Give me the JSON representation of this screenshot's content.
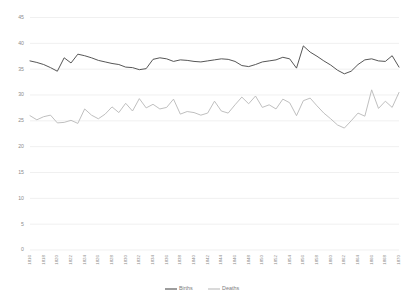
{
  "chart_data": {
    "type": "line",
    "title": "",
    "subtitle": "",
    "xlabel": "",
    "ylabel": "",
    "ylim": [
      0,
      45
    ],
    "ytick_step": 5,
    "yticks": [
      0,
      5,
      10,
      15,
      20,
      25,
      30,
      35,
      40,
      45
    ],
    "grid": true,
    "grid_axis": "y",
    "legend_position": "bottom-center",
    "x": [
      1816,
      1817,
      1818,
      1819,
      1820,
      1821,
      1822,
      1823,
      1824,
      1825,
      1826,
      1827,
      1828,
      1829,
      1830,
      1831,
      1832,
      1833,
      1834,
      1835,
      1836,
      1837,
      1838,
      1839,
      1840,
      1841,
      1842,
      1843,
      1844,
      1845,
      1846,
      1847,
      1848,
      1849,
      1850,
      1851,
      1852,
      1853,
      1854,
      1855,
      1856,
      1857,
      1858,
      1859,
      1860,
      1861,
      1862,
      1863,
      1864,
      1865,
      1866,
      1867,
      1868,
      1869,
      1870
    ],
    "xtick_labels": [
      "1816",
      "1818",
      "1820",
      "1822",
      "1824",
      "1826",
      "1828",
      "1830",
      "1832",
      "1834",
      "1836",
      "1838",
      "1840",
      "1842",
      "1844",
      "1846",
      "1848",
      "1850",
      "1852",
      "1854",
      "1856",
      "1858",
      "1860",
      "1862",
      "1864",
      "1866",
      "1868",
      "1870"
    ],
    "xtick_values": [
      1816,
      1818,
      1820,
      1822,
      1824,
      1826,
      1828,
      1830,
      1832,
      1834,
      1836,
      1838,
      1840,
      1842,
      1844,
      1846,
      1848,
      1850,
      1852,
      1854,
      1856,
      1858,
      1860,
      1862,
      1864,
      1866,
      1868,
      1870
    ],
    "xtick_rotation": -90,
    "series": [
      {
        "name": "Births",
        "color": "#4d4d4d",
        "values": [
          36.6,
          36.3,
          35.9,
          35.3,
          34.6,
          37.2,
          36.2,
          37.9,
          37.6,
          37.2,
          36.7,
          36.4,
          36.1,
          35.9,
          35.4,
          35.3,
          34.9,
          35.1,
          36.9,
          37.2,
          37.0,
          36.5,
          36.8,
          36.7,
          36.5,
          36.4,
          36.6,
          36.8,
          37.0,
          36.9,
          36.5,
          35.7,
          35.5,
          35.9,
          36.4,
          36.6,
          36.8,
          37.3,
          37.0,
          35.2,
          39.5,
          38.3,
          37.5,
          36.6,
          35.8,
          34.8,
          34.1,
          34.6,
          35.9,
          36.8,
          37.0,
          36.6,
          36.5,
          37.6,
          35.4
        ]
      },
      {
        "name": "Deaths",
        "color": "#bcbcbc",
        "values": [
          26.0,
          25.2,
          25.8,
          26.1,
          24.6,
          24.7,
          25.1,
          24.5,
          27.3,
          26.1,
          25.4,
          26.3,
          27.7,
          26.6,
          28.4,
          26.9,
          29.3,
          27.5,
          28.2,
          27.3,
          27.6,
          29.2,
          26.3,
          26.8,
          26.6,
          26.1,
          26.5,
          28.8,
          26.9,
          26.5,
          28.1,
          29.6,
          28.3,
          29.8,
          27.6,
          28.1,
          27.3,
          29.2,
          28.5,
          26.0,
          28.9,
          29.4,
          27.9,
          26.5,
          25.4,
          24.2,
          23.6,
          25.0,
          26.5,
          25.9,
          31.0,
          27.4,
          28.8,
          27.6,
          30.5
        ]
      }
    ]
  },
  "legend": {
    "entries": [
      {
        "label": "Births",
        "color": "#4d4d4d"
      },
      {
        "label": "Deaths",
        "color": "#bcbcbc"
      }
    ]
  },
  "axis": {
    "y_top_label": "45",
    "y_bottom_label": "0"
  }
}
